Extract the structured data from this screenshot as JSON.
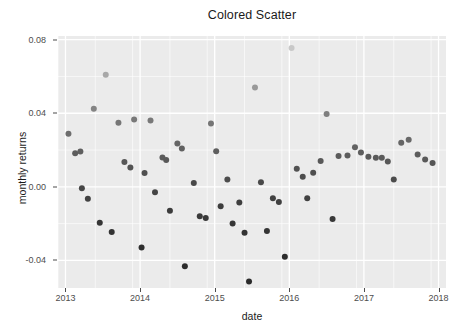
{
  "artifact_text": "",
  "chart_data": {
    "type": "scatter",
    "title": "Colored Scatter",
    "xlabel": "date",
    "ylabel": "monthly returns",
    "xlim": [
      2012.9,
      2018.1
    ],
    "ylim": [
      -0.055,
      0.082
    ],
    "grid": true,
    "legend": "none",
    "panel_background": "#ebebeb",
    "grid_color": "#ffffff",
    "color_scale": {
      "low": "#2b2b2b",
      "high": "#c8c8c8",
      "description": "point grey level keyed to monthly returns value (darker = lower, lighter = higher)"
    },
    "xticks": [
      2013,
      2014,
      2015,
      2016,
      2017,
      2018
    ],
    "xtick_labels": [
      "2013",
      "2014",
      "2015",
      "2016",
      "2017",
      "2018"
    ],
    "yticks": [
      -0.04,
      0.0,
      0.04,
      0.08
    ],
    "ytick_labels": [
      "-0.04",
      "0.00",
      "0.04",
      "0.08"
    ],
    "point_count": 61,
    "points": [
      {
        "x": 2013.04,
        "y": 0.0288
      },
      {
        "x": 2013.13,
        "y": 0.0183
      },
      {
        "x": 2013.2,
        "y": 0.0192
      },
      {
        "x": 2013.22,
        "y": -0.0008
      },
      {
        "x": 2013.3,
        "y": -0.0065
      },
      {
        "x": 2013.38,
        "y": 0.0425
      },
      {
        "x": 2013.46,
        "y": -0.0195
      },
      {
        "x": 2013.54,
        "y": 0.061
      },
      {
        "x": 2013.62,
        "y": -0.0245
      },
      {
        "x": 2013.71,
        "y": 0.0348
      },
      {
        "x": 2013.79,
        "y": 0.0135
      },
      {
        "x": 2013.87,
        "y": 0.0105
      },
      {
        "x": 2013.92,
        "y": 0.0366
      },
      {
        "x": 2014.02,
        "y": -0.033
      },
      {
        "x": 2014.06,
        "y": 0.0075
      },
      {
        "x": 2014.14,
        "y": 0.036
      },
      {
        "x": 2014.2,
        "y": -0.003
      },
      {
        "x": 2014.3,
        "y": 0.016
      },
      {
        "x": 2014.35,
        "y": 0.0146
      },
      {
        "x": 2014.4,
        "y": -0.013
      },
      {
        "x": 2014.5,
        "y": 0.0235
      },
      {
        "x": 2014.56,
        "y": 0.0208
      },
      {
        "x": 2014.6,
        "y": -0.0432
      },
      {
        "x": 2014.72,
        "y": 0.0021
      },
      {
        "x": 2014.8,
        "y": -0.016
      },
      {
        "x": 2014.88,
        "y": -0.017
      },
      {
        "x": 2014.95,
        "y": 0.0344
      },
      {
        "x": 2015.02,
        "y": 0.0193
      },
      {
        "x": 2015.08,
        "y": -0.0105
      },
      {
        "x": 2015.17,
        "y": 0.004
      },
      {
        "x": 2015.24,
        "y": -0.02
      },
      {
        "x": 2015.33,
        "y": -0.0085
      },
      {
        "x": 2015.4,
        "y": -0.025
      },
      {
        "x": 2015.46,
        "y": -0.0515
      },
      {
        "x": 2015.54,
        "y": 0.054
      },
      {
        "x": 2015.62,
        "y": 0.0025
      },
      {
        "x": 2015.7,
        "y": -0.024
      },
      {
        "x": 2015.78,
        "y": -0.0062
      },
      {
        "x": 2015.86,
        "y": -0.0082
      },
      {
        "x": 2015.94,
        "y": -0.038
      },
      {
        "x": 2016.03,
        "y": 0.0755
      },
      {
        "x": 2016.1,
        "y": 0.0098
      },
      {
        "x": 2016.18,
        "y": 0.0055
      },
      {
        "x": 2016.24,
        "y": -0.0062
      },
      {
        "x": 2016.32,
        "y": 0.0076
      },
      {
        "x": 2016.42,
        "y": 0.014
      },
      {
        "x": 2016.5,
        "y": 0.0396
      },
      {
        "x": 2016.58,
        "y": -0.0175
      },
      {
        "x": 2016.66,
        "y": 0.0168
      },
      {
        "x": 2016.78,
        "y": 0.017
      },
      {
        "x": 2016.88,
        "y": 0.0215
      },
      {
        "x": 2016.96,
        "y": 0.0186
      },
      {
        "x": 2017.06,
        "y": 0.0164
      },
      {
        "x": 2017.16,
        "y": 0.0158
      },
      {
        "x": 2017.24,
        "y": 0.0158
      },
      {
        "x": 2017.32,
        "y": 0.0138
      },
      {
        "x": 2017.4,
        "y": 0.004
      },
      {
        "x": 2017.5,
        "y": 0.024
      },
      {
        "x": 2017.6,
        "y": 0.0256
      },
      {
        "x": 2017.72,
        "y": 0.0176
      },
      {
        "x": 2017.82,
        "y": 0.0148
      },
      {
        "x": 2017.92,
        "y": 0.013
      }
    ]
  }
}
